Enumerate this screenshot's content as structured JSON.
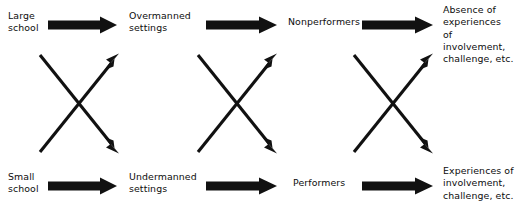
{
  "diagram": {
    "type": "flow-diagram",
    "title": "",
    "background_color": "#ffffff",
    "ink_color": "#111111",
    "columns": [
      {
        "name": "school-size",
        "top_label": "Large\nschool",
        "bottom_label": "Small\nschool"
      },
      {
        "name": "manning-setting",
        "top_label": "Overmanned\nsettings",
        "bottom_label": "Undermanned\nsettings"
      },
      {
        "name": "performance",
        "top_label": "Nonperformers",
        "bottom_label": "Performers"
      },
      {
        "name": "experience-outcome",
        "top_label": "Absence of\nexperiences\nof involvement,\nchallenge, etc.",
        "bottom_label": "Experiences of\ninvolvement,\nchallenge, etc."
      }
    ],
    "block_arrows": [
      {
        "name": "arrow-large-school-to-overmanned",
        "row": "top",
        "stage": 1
      },
      {
        "name": "arrow-overmanned-to-nonperformers",
        "row": "top",
        "stage": 2
      },
      {
        "name": "arrow-nonperformers-to-absence",
        "row": "top",
        "stage": 3
      },
      {
        "name": "arrow-small-school-to-undermanned",
        "row": "bottom",
        "stage": 1
      },
      {
        "name": "arrow-undermanned-to-performers",
        "row": "bottom",
        "stage": 2
      },
      {
        "name": "arrow-performers-to-experiences",
        "row": "bottom",
        "stage": 3
      }
    ],
    "cross_arrows": [
      {
        "name": "crossing-arrows-stage-1",
        "stage": 1,
        "description": "downward and upward diagonal arrows forming an X"
      },
      {
        "name": "crossing-arrows-stage-2",
        "stage": 2,
        "description": "downward and upward diagonal arrows forming an X"
      },
      {
        "name": "crossing-arrows-stage-3",
        "stage": 3,
        "description": "downward and upward diagonal arrows forming an X"
      }
    ]
  }
}
